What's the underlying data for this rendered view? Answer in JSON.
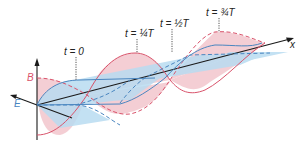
{
  "diagram": {
    "axes": {
      "x_label": "x",
      "b_label": "B",
      "e_label": "E"
    },
    "time_labels": [
      {
        "id": "t0",
        "text": "t = 0"
      },
      {
        "id": "t1",
        "text": "t = ¼T"
      },
      {
        "id": "t2",
        "text": "t = ½T"
      },
      {
        "id": "t3",
        "text": "t = ¾T"
      }
    ],
    "colors": {
      "b_field": "#d9536b",
      "b_fill": "#f3c6cd",
      "e_field": "#4a86c0",
      "e_fill": "#b9dcf1",
      "axis": "#1a1a1a",
      "leader": "#555555"
    }
  }
}
